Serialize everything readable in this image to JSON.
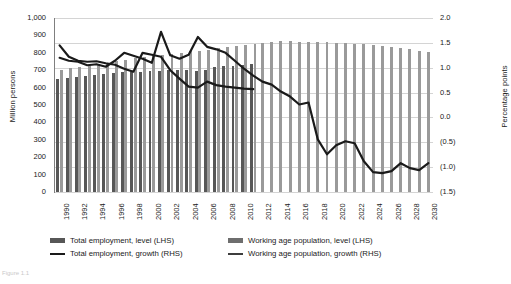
{
  "chart_data": {
    "type": "bar",
    "title": "",
    "xlabel": "",
    "ylabel": "Million persons",
    "y2label": "Percentage points",
    "grid": true,
    "legend_position": "bottom",
    "ylim": [
      0,
      1000
    ],
    "y2lim": [
      -1.5,
      2.0
    ],
    "y_ticks": [
      "0",
      "100",
      "200",
      "300",
      "400",
      "500",
      "600",
      "700",
      "800",
      "900",
      "1,000"
    ],
    "y_tick_values": [
      0,
      100,
      200,
      300,
      400,
      500,
      600,
      700,
      800,
      900,
      1000
    ],
    "y2_ticks": [
      "(1.5)",
      "(1.0)",
      "(0.5)",
      "0.0",
      "0.5",
      "1.0",
      "1.5",
      "2.0"
    ],
    "y2_tick_values": [
      -1.5,
      -1.0,
      -0.5,
      0.0,
      0.5,
      1.0,
      1.5,
      2.0
    ],
    "x": [
      1990,
      1991,
      1992,
      1993,
      1994,
      1995,
      1996,
      1997,
      1998,
      1999,
      2000,
      2001,
      2002,
      2003,
      2004,
      2005,
      2006,
      2007,
      2008,
      2009,
      2010,
      2011,
      2012,
      2013,
      2014,
      2015,
      2016,
      2017,
      2018,
      2019,
      2020,
      2021,
      2022,
      2023,
      2024,
      2025,
      2026,
      2027,
      2028,
      2029,
      2030
    ],
    "x_tick_labels": [
      "1990",
      "1992",
      "1994",
      "1996",
      "1998",
      "2000",
      "2002",
      "2004",
      "2006",
      "2008",
      "2010",
      "2012",
      "2014",
      "2016",
      "2018",
      "2020",
      "2022",
      "2024",
      "2026",
      "2028",
      "2030"
    ],
    "x_tick_values": [
      1990,
      1992,
      1994,
      1996,
      1998,
      2000,
      2002,
      2004,
      2006,
      2008,
      2010,
      2012,
      2014,
      2016,
      2018,
      2020,
      2022,
      2024,
      2026,
      2028,
      2030
    ],
    "series": [
      {
        "name": "Total employment, level (LHS)",
        "type": "bar",
        "axis": "left",
        "color": "#575757",
        "values": [
          648,
          655,
          661,
          666,
          672,
          678,
          683,
          688,
          690,
          692,
          694,
          697,
          700,
          703,
          700,
          698,
          702,
          716,
          722,
          726,
          730,
          735,
          null,
          null,
          null,
          null,
          null,
          null,
          null,
          null,
          null,
          null,
          null,
          null,
          null,
          null,
          null,
          null,
          null,
          null,
          null
        ]
      },
      {
        "name": "Working age population, level (LHS)",
        "type": "bar",
        "axis": "left",
        "color": "#9a9a9a",
        "values": [
          700,
          710,
          718,
          727,
          735,
          744,
          752,
          761,
          769,
          777,
          780,
          786,
          792,
          800,
          808,
          811,
          818,
          826,
          832,
          838,
          845,
          852,
          858,
          862,
          866,
          866,
          865,
          864,
          862,
          860,
          858,
          855,
          852,
          848,
          843,
          838,
          832,
          826,
          820,
          812,
          806
        ]
      },
      {
        "name": "Total employment, growth (RHS)",
        "type": "line",
        "axis": "right",
        "color": "#1a1a1a",
        "values": [
          1.45,
          1.22,
          1.14,
          1.12,
          1.13,
          1.09,
          1.06,
          0.98,
          0.92,
          1.3,
          1.26,
          1.22,
          0.95,
          0.78,
          0.62,
          0.6,
          0.72,
          0.65,
          0.62,
          0.6,
          0.58,
          0.57,
          null,
          null,
          null,
          null,
          null,
          null,
          null,
          null,
          null,
          null,
          null,
          null,
          null,
          null,
          null,
          null,
          null,
          null,
          null
        ]
      },
      {
        "name": "Working age population, growth (RHS)",
        "type": "line",
        "axis": "right",
        "color": "#1a1a1a",
        "values": [
          1.2,
          1.14,
          1.12,
          1.05,
          1.07,
          1.02,
          1.14,
          1.3,
          1.24,
          1.18,
          1.1,
          1.72,
          1.25,
          1.18,
          1.26,
          1.62,
          1.42,
          1.37,
          1.3,
          1.14,
          0.98,
          0.84,
          0.72,
          0.66,
          0.52,
          0.42,
          0.26,
          0.3,
          -0.44,
          -0.74,
          -0.56,
          -0.48,
          -0.52,
          -0.88,
          -1.1,
          -1.12,
          -1.08,
          -0.92,
          -1.02,
          -1.06,
          -0.92
        ]
      }
    ]
  },
  "y_axis_left": {
    "title": "Million persons",
    "ticks": [
      "1,000",
      "900",
      "800",
      "700",
      "600",
      "500",
      "400",
      "300",
      "200",
      "100",
      "0"
    ]
  },
  "y_axis_right": {
    "title": "Percentage points",
    "ticks": [
      "2.0",
      "1.5",
      "1.0",
      "0.5",
      "0.0",
      "(0.5)",
      "(1.0)",
      "(1.5)"
    ]
  },
  "x_axis": {
    "labels": [
      "1990",
      "1992",
      "1994",
      "1996",
      "1998",
      "2000",
      "2002",
      "2004",
      "2006",
      "2008",
      "2010",
      "2012",
      "2014",
      "2016",
      "2018",
      "2020",
      "2022",
      "2024",
      "2026",
      "2028",
      "2030"
    ]
  },
  "legend": {
    "items": [
      {
        "label": "Total employment, level (LHS)",
        "marker": "bar",
        "color": "#575757"
      },
      {
        "label": "Working age population, level (LHS)",
        "marker": "bar",
        "color": "#6e6e6e"
      },
      {
        "label": "Total employment, growth (RHS)",
        "marker": "line",
        "color": "#1a1a1a"
      },
      {
        "label": "Working age population, growth (RHS)",
        "marker": "line",
        "color": "#3d3d3d"
      }
    ]
  },
  "caption": "Figure 1.1"
}
